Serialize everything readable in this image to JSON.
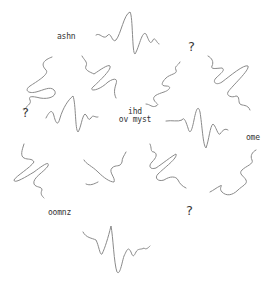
{
  "diagram": {
    "center_label": {
      "line1": "ihd",
      "line2": "ov myst"
    },
    "labels": [
      {
        "id": "top-left",
        "text": "ashn"
      },
      {
        "id": "right",
        "text": "ome"
      },
      {
        "id": "bottom-left",
        "text": "oomnz"
      }
    ],
    "question_marks": [
      {
        "id": "top-right",
        "text": "?"
      },
      {
        "id": "left",
        "text": "?"
      },
      {
        "id": "bottom-right",
        "text": "?"
      }
    ],
    "stroke_color": "#8a8a8a",
    "text_color": "#333333"
  }
}
